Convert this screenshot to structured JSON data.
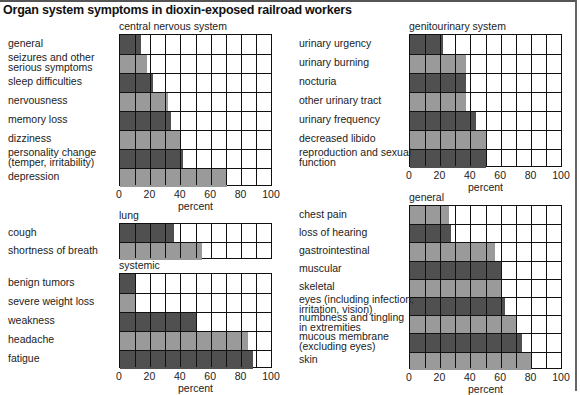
{
  "title": "Organ system symptoms in dioxin-exposed railroad workers",
  "colors": {
    "dark_bar": "#505050",
    "light_bar": "#9a9a9a",
    "grid": "#111111"
  },
  "axis": {
    "ticks": [
      "0",
      "20",
      "40",
      "60",
      "80",
      "100"
    ],
    "xlabel": "percent"
  },
  "chart_data": [
    {
      "type": "bar",
      "orientation": "horizontal",
      "title": "central nervous system",
      "xlabel": "percent",
      "xlim": [
        0,
        100
      ],
      "categories": [
        "general",
        "seizures and other serious symptoms",
        "sleep difficulties",
        "nervousness",
        "memory loss",
        "dizziness",
        "personality change (temper, irritability)",
        "depression"
      ],
      "values": [
        14,
        18,
        22,
        32,
        34,
        40,
        42,
        71
      ]
    },
    {
      "type": "bar",
      "orientation": "horizontal",
      "title": "lung",
      "xlabel": "",
      "xlim": [
        0,
        100
      ],
      "categories": [
        "cough",
        "shortness of breath"
      ],
      "values": [
        36,
        54
      ]
    },
    {
      "type": "bar",
      "orientation": "horizontal",
      "title": "systemic",
      "xlabel": "percent",
      "xlim": [
        0,
        100
      ],
      "categories": [
        "benign tumors",
        "severe weight loss",
        "weakness",
        "headache",
        "fatigue"
      ],
      "values": [
        10,
        10,
        50,
        85,
        88
      ]
    },
    {
      "type": "bar",
      "orientation": "horizontal",
      "title": "genitourinary system",
      "xlabel": "percent",
      "xlim": [
        0,
        100
      ],
      "categories": [
        "urinary urgency",
        "urinary burning",
        "nocturia",
        "other urinary tract",
        "urinary frequency",
        "decreased libido",
        "reproduction and sexual function"
      ],
      "values": [
        22,
        37,
        37,
        37,
        44,
        50,
        50
      ]
    },
    {
      "type": "bar",
      "orientation": "horizontal",
      "title": "general",
      "xlabel": "percent",
      "xlim": [
        0,
        100
      ],
      "categories": [
        "chest pain",
        "loss of hearing",
        "gastrointestinal",
        "muscular",
        "skeletal",
        "eyes (including infection, irritation, vision)",
        "numbness and tingling in extremities",
        "mucous membrane (excluding eyes)",
        "skin"
      ],
      "values": [
        26,
        27,
        56,
        61,
        61,
        63,
        70,
        74,
        80
      ]
    }
  ],
  "panels": {
    "cns": {
      "title": "central nervous system",
      "labels": [
        [
          "general"
        ],
        [
          "seizures and other",
          "serious symptoms"
        ],
        [
          "sleep difficulties"
        ],
        [
          "nervousness"
        ],
        [
          "memory loss"
        ],
        [
          "dizziness"
        ],
        [
          "personality change",
          "(temper, irritability)"
        ],
        [
          "depression"
        ]
      ]
    },
    "lung": {
      "title": "lung",
      "labels": [
        [
          "cough"
        ],
        [
          "shortness of breath"
        ]
      ]
    },
    "systemic": {
      "title": "systemic",
      "labels": [
        [
          "benign tumors"
        ],
        [
          "severe weight loss"
        ],
        [
          "weakness"
        ],
        [
          "headache"
        ],
        [
          "fatigue"
        ]
      ]
    },
    "gu": {
      "title": "genitourinary system",
      "labels": [
        [
          "urinary urgency"
        ],
        [
          "urinary burning"
        ],
        [
          "nocturia"
        ],
        [
          "other urinary tract"
        ],
        [
          "urinary frequency"
        ],
        [
          "decreased libido"
        ],
        [
          "reproduction and sexual",
          "function"
        ]
      ]
    },
    "general": {
      "title": "general",
      "labels": [
        [
          "chest pain"
        ],
        [
          "loss of hearing"
        ],
        [
          "gastrointestinal"
        ],
        [
          "muscular"
        ],
        [
          "skeletal"
        ],
        [
          "eyes (including infection,",
          "irritation, vision)"
        ],
        [
          "numbness and tingling",
          "in extremities"
        ],
        [
          "mucous membrane",
          "(excluding eyes)"
        ],
        [
          "skin"
        ]
      ]
    }
  }
}
